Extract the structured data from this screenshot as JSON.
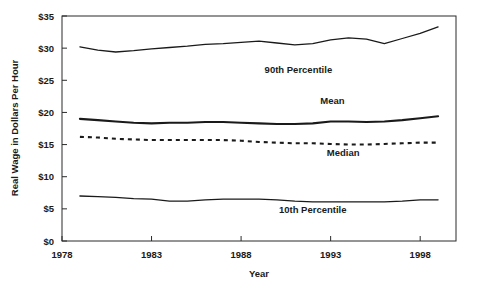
{
  "chart_data": {
    "type": "line",
    "title": "",
    "xlabel": "Year",
    "ylabel": "Real Wage in Dollars Per Hour",
    "xlim": [
      1978,
      2000
    ],
    "ylim": [
      0,
      35
    ],
    "xticks": [
      1978,
      1983,
      1988,
      1993,
      1998
    ],
    "xtick_labels": [
      "1978",
      "1983",
      "1988",
      "1993",
      "1998"
    ],
    "yticks": [
      0,
      5,
      10,
      15,
      20,
      25,
      30,
      35
    ],
    "ytick_labels": [
      "$0",
      "$5",
      "$10",
      "$15",
      "$20",
      "$25",
      "$30",
      "$35"
    ],
    "grid": false,
    "legend_position": "inline-annotations",
    "x": [
      1979,
      1980,
      1981,
      1982,
      1983,
      1984,
      1985,
      1986,
      1987,
      1988,
      1989,
      1990,
      1991,
      1992,
      1993,
      1994,
      1995,
      1996,
      1997,
      1998,
      1999
    ],
    "series": [
      {
        "name": "90th Percentile",
        "style": "solid-thin",
        "label_x": 1991.2,
        "label_y": 26.1,
        "values": [
          30.2,
          29.7,
          29.4,
          29.6,
          29.9,
          30.1,
          30.3,
          30.6,
          30.7,
          30.9,
          31.1,
          30.8,
          30.5,
          30.7,
          31.3,
          31.6,
          31.4,
          30.7,
          31.5,
          32.3,
          33.3
        ]
      },
      {
        "name": "Mean",
        "style": "solid-thick",
        "label_x": 1993.1,
        "label_y": 21.3,
        "values": [
          19.0,
          18.8,
          18.6,
          18.4,
          18.3,
          18.4,
          18.4,
          18.5,
          18.5,
          18.4,
          18.3,
          18.2,
          18.2,
          18.3,
          18.6,
          18.6,
          18.5,
          18.6,
          18.8,
          19.1,
          19.4
        ]
      },
      {
        "name": "Median",
        "style": "dashed",
        "label_x": 1993.7,
        "label_y": 13.2,
        "values": [
          16.2,
          16.1,
          15.9,
          15.8,
          15.7,
          15.7,
          15.7,
          15.7,
          15.7,
          15.6,
          15.4,
          15.3,
          15.2,
          15.2,
          15.1,
          15.0,
          15.0,
          15.1,
          15.2,
          15.3,
          15.3
        ]
      },
      {
        "name": "10th Percentile",
        "style": "solid-thin",
        "label_x": 1992.0,
        "label_y": 4.4,
        "values": [
          7.0,
          6.9,
          6.8,
          6.6,
          6.5,
          6.2,
          6.2,
          6.4,
          6.5,
          6.5,
          6.5,
          6.4,
          6.2,
          6.1,
          6.1,
          6.1,
          6.1,
          6.1,
          6.2,
          6.4,
          6.4
        ]
      }
    ]
  }
}
